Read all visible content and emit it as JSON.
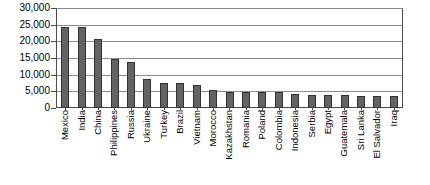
{
  "chart_data": {
    "type": "bar",
    "title": "",
    "xlabel": "",
    "ylabel": "",
    "ylim": [
      0,
      30000
    ],
    "ytick_values": [
      0,
      5000,
      10000,
      15000,
      20000,
      25000,
      30000
    ],
    "ytick_labels": [
      "0",
      "5,000",
      "10,000",
      "15,000",
      "20,000",
      "25,000",
      "30,000"
    ],
    "grid": true,
    "legend": "none",
    "bar_color": "#636363",
    "bar_border_color": "#333333",
    "categories": [
      "Mexico",
      "India",
      "China",
      "Philippines",
      "Russia",
      "Ukraine",
      "Turkey",
      "Brazil",
      "Vietnam",
      "Morocco",
      "Kazakhstan",
      "Romania",
      "Poland",
      "Colombia",
      "Indonesia",
      "Serbia",
      "Egypt",
      "Guatemala",
      "Sri Lanka",
      "El Salvador",
      "Iraq"
    ],
    "values": [
      24500,
      24700,
      21000,
      14900,
      14000,
      8700,
      7600,
      7500,
      7000,
      5400,
      5000,
      5000,
      5000,
      4900,
      4300,
      4000,
      3900,
      3800,
      3700,
      3600,
      3500
    ]
  }
}
